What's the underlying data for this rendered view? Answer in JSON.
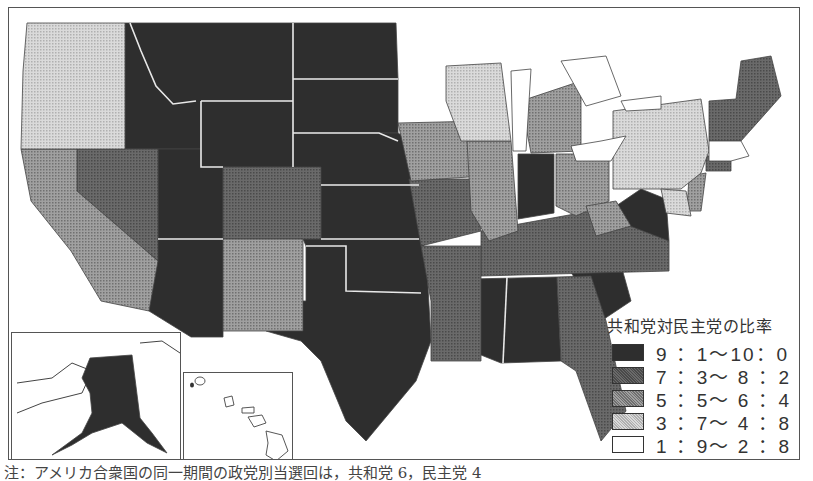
{
  "legend": {
    "title": "共和党対民主党の比率",
    "items": [
      {
        "label": "9 ：1〜10：0",
        "fill": "#2e2e2e"
      },
      {
        "label": "7 ：3〜 8 ：2",
        "fill": "#5c5c5c"
      },
      {
        "label": "5 ：5〜 6 ：4",
        "fill": "#8a8a8a"
      },
      {
        "label": "3 ：7〜 4 ：8",
        "fill": "#c6c6c6"
      },
      {
        "label": "1 ：9〜 2 ：8",
        "fill": "#ffffff"
      }
    ]
  },
  "note": "注：アメリカ合衆国の同一期間の政党別当選回は，共和党 6，民主党 4",
  "insets": {
    "alaska": {
      "label": "Alaska",
      "category": "9:1-10:0"
    },
    "hawaii": {
      "label": "Hawaii",
      "category": "1:9-2:8"
    }
  },
  "colors": {
    "c1": "#2e2e2e",
    "c2": "#5c5c5c",
    "c3": "#8a8a8a",
    "c4": "#c6c6c6",
    "c5": "#ffffff",
    "border": "#555555"
  }
}
